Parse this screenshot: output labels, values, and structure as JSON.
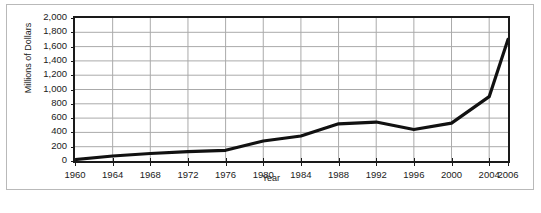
{
  "chart_data": {
    "type": "line",
    "title": "",
    "xlabel": "Year",
    "ylabel": "Millions of Dollars",
    "xlim": [
      1960,
      2006
    ],
    "ylim": [
      0,
      2000
    ],
    "grid": true,
    "legend": false,
    "y_ticks": [
      "2,000",
      "1,800",
      "1,600",
      "1,400",
      "1,200",
      "1,000",
      "800",
      "600",
      "400",
      "200",
      "0"
    ],
    "y_tick_values": [
      2000,
      1800,
      1600,
      1400,
      1200,
      1000,
      800,
      600,
      400,
      200,
      0
    ],
    "x_ticks": [
      "1960",
      "1964",
      "1968",
      "1972",
      "1976",
      "1980",
      "1984",
      "1988",
      "1992",
      "1996",
      "2000",
      "2004",
      "2006"
    ],
    "x_tick_values": [
      1960,
      1964,
      1968,
      1972,
      1976,
      1980,
      1984,
      1988,
      1992,
      1996,
      2000,
      2004,
      2006
    ],
    "series": [
      {
        "name": "Millions of Dollars",
        "color": "#111111",
        "x": [
          1960,
          1964,
          1968,
          1972,
          1976,
          1980,
          1984,
          1988,
          1992,
          1996,
          2000,
          2004,
          2006
        ],
        "values": [
          20,
          70,
          105,
          130,
          150,
          280,
          350,
          520,
          545,
          440,
          530,
          900,
          1700
        ]
      }
    ],
    "line_color": "#111111",
    "grid_color": "#aaaaaa",
    "axis_color": "#1a1a1a",
    "background": "#ffffff"
  }
}
